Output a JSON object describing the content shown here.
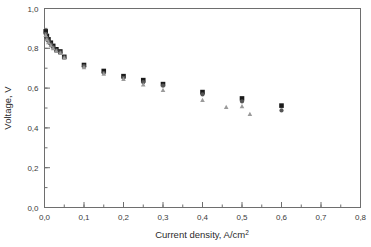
{
  "chart_data": {
    "type": "scatter",
    "title": "",
    "xlabel": "Current density, A/cm2",
    "xlabel_base": "Current density, A/cm",
    "xlabel_sup": "2",
    "ylabel": "Voltage, V",
    "xlim": [
      0.0,
      0.8
    ],
    "ylim": [
      0.0,
      1.0
    ],
    "xticks": [
      0.0,
      0.1,
      0.2,
      0.3,
      0.4,
      0.5,
      0.6,
      0.7,
      0.8
    ],
    "xticklabels": [
      "0,0",
      "0,1",
      "0,2",
      "0,3",
      "0,4",
      "0,5",
      "0,6",
      "0,7",
      "0,8"
    ],
    "yticks": [
      0.0,
      0.2,
      0.4,
      0.6,
      0.8,
      1.0
    ],
    "yticklabels": [
      "0,0",
      "0,2",
      "0,4",
      "0,6",
      "0,8",
      "1,0"
    ],
    "xtick_minor_step": 0.05,
    "ytick_minor_step": 0.1,
    "grid": false,
    "legend": "none",
    "decimal_separator": ",",
    "series": [
      {
        "name": "series-1",
        "marker": "square",
        "color": "#1a1a1a",
        "size": 4.6,
        "points": [
          {
            "x": 0.003,
            "y": 0.885
          },
          {
            "x": 0.006,
            "y": 0.862
          },
          {
            "x": 0.01,
            "y": 0.845
          },
          {
            "x": 0.016,
            "y": 0.828
          },
          {
            "x": 0.022,
            "y": 0.812
          },
          {
            "x": 0.03,
            "y": 0.795
          },
          {
            "x": 0.04,
            "y": 0.784
          },
          {
            "x": 0.05,
            "y": 0.757
          },
          {
            "x": 0.1,
            "y": 0.716
          },
          {
            "x": 0.15,
            "y": 0.686
          },
          {
            "x": 0.2,
            "y": 0.66
          },
          {
            "x": 0.25,
            "y": 0.64
          },
          {
            "x": 0.3,
            "y": 0.62
          },
          {
            "x": 0.4,
            "y": 0.58
          },
          {
            "x": 0.5,
            "y": 0.548
          },
          {
            "x": 0.6,
            "y": 0.512
          }
        ]
      },
      {
        "name": "series-2",
        "marker": "circle",
        "color": "#555555",
        "size": 4.2,
        "points": [
          {
            "x": 0.003,
            "y": 0.872
          },
          {
            "x": 0.006,
            "y": 0.85
          },
          {
            "x": 0.01,
            "y": 0.836
          },
          {
            "x": 0.016,
            "y": 0.82
          },
          {
            "x": 0.022,
            "y": 0.805
          },
          {
            "x": 0.03,
            "y": 0.79
          },
          {
            "x": 0.04,
            "y": 0.78
          },
          {
            "x": 0.05,
            "y": 0.754
          },
          {
            "x": 0.1,
            "y": 0.71
          },
          {
            "x": 0.15,
            "y": 0.676
          },
          {
            "x": 0.2,
            "y": 0.652
          },
          {
            "x": 0.25,
            "y": 0.63
          },
          {
            "x": 0.3,
            "y": 0.612
          },
          {
            "x": 0.4,
            "y": 0.568
          },
          {
            "x": 0.5,
            "y": 0.533
          },
          {
            "x": 0.6,
            "y": 0.488
          }
        ]
      },
      {
        "name": "series-3",
        "marker": "triangle",
        "color": "#9a9a9a",
        "size": 4.6,
        "points": [
          {
            "x": 0.003,
            "y": 0.866
          },
          {
            "x": 0.006,
            "y": 0.845
          },
          {
            "x": 0.01,
            "y": 0.83
          },
          {
            "x": 0.016,
            "y": 0.815
          },
          {
            "x": 0.022,
            "y": 0.8
          },
          {
            "x": 0.03,
            "y": 0.786
          },
          {
            "x": 0.04,
            "y": 0.776
          },
          {
            "x": 0.05,
            "y": 0.752
          },
          {
            "x": 0.1,
            "y": 0.705
          },
          {
            "x": 0.15,
            "y": 0.672
          },
          {
            "x": 0.2,
            "y": 0.646
          },
          {
            "x": 0.25,
            "y": 0.618
          },
          {
            "x": 0.3,
            "y": 0.59
          },
          {
            "x": 0.4,
            "y": 0.54
          },
          {
            "x": 0.46,
            "y": 0.505
          },
          {
            "x": 0.5,
            "y": 0.508
          },
          {
            "x": 0.52,
            "y": 0.47
          }
        ]
      }
    ]
  }
}
